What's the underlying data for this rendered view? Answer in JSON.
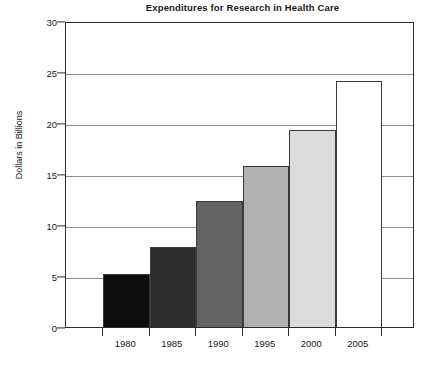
{
  "chart_data": {
    "type": "bar",
    "title": "Expenditures for Research in Health Care",
    "xlabel": "",
    "ylabel": "Dollars in Billions",
    "categories": [
      "1980",
      "1985",
      "1990",
      "1995",
      "2000",
      "2005"
    ],
    "values": [
      5.2,
      7.8,
      12.4,
      15.8,
      19.3,
      24.1
    ],
    "ylim": [
      0,
      30
    ],
    "yticks": [
      0,
      5,
      10,
      15,
      20,
      25,
      30
    ],
    "ytick_labels": [
      "0",
      "5",
      "10",
      "15",
      "20",
      "25",
      "30"
    ],
    "grid": true,
    "legend": "none",
    "bar_colors": [
      "#0d0d0d",
      "#2e2e2e",
      "#636363",
      "#b0b0b0",
      "#dcdcdc",
      "#ffffff"
    ],
    "bar_edge_color": "#3a3a3a",
    "axis_color": "#2b2b2b",
    "gridline_color": "#8d8d8d",
    "background": "#ffffff",
    "bars": [
      {
        "category": "1980",
        "value": 5.2,
        "color": "#0d0d0d"
      },
      {
        "category": "1985",
        "value": 7.8,
        "color": "#2e2e2e"
      },
      {
        "category": "1990",
        "value": 12.4,
        "color": "#636363"
      },
      {
        "category": "1995",
        "value": 15.8,
        "color": "#b0b0b0"
      },
      {
        "category": "2000",
        "value": 19.3,
        "color": "#dcdcdc"
      },
      {
        "category": "2005",
        "value": 24.1,
        "color": "#ffffff"
      }
    ]
  }
}
